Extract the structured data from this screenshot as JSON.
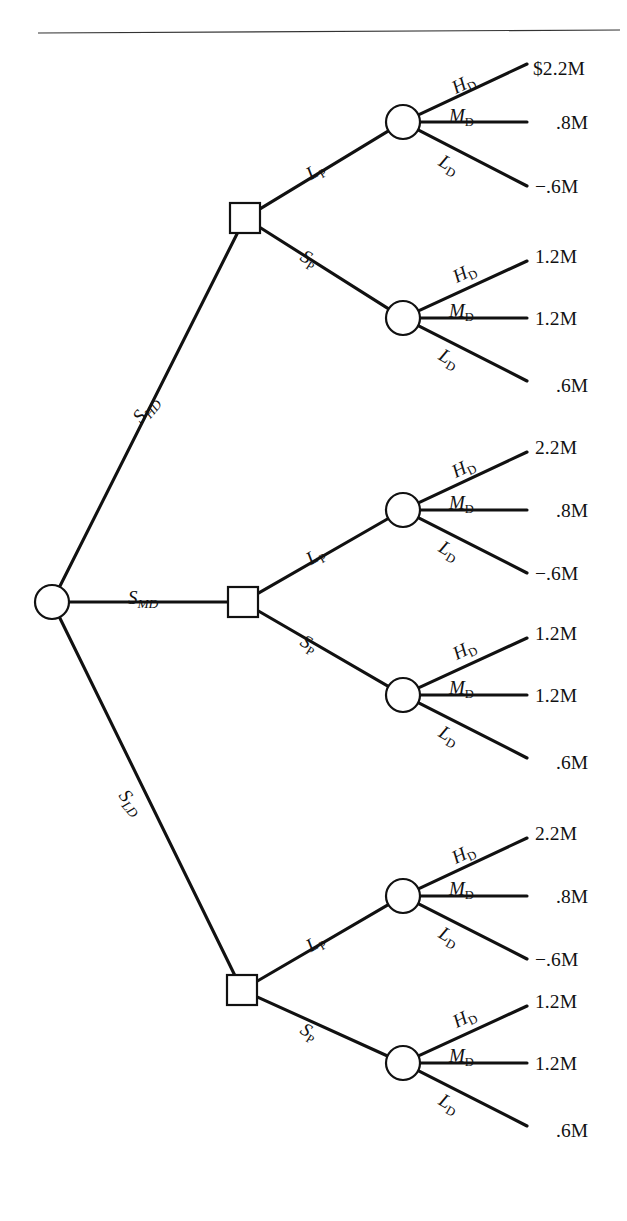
{
  "diagram": {
    "type": "decision-tree",
    "top_rule": {
      "present": true,
      "x1": 38,
      "y1": 33,
      "x2": 620,
      "y2": 30
    }
  },
  "root": {
    "node_type": "chance",
    "label": "root-chance-node",
    "x": 52,
    "y": 602,
    "r": 17
  },
  "state_branches": [
    {
      "id": "S_HD",
      "base": "S",
      "sub": "HD",
      "target_x": 245,
      "target_y": 218,
      "label_x": 128,
      "label_y": 413,
      "rotate": -50
    },
    {
      "id": "S_MD",
      "base": "S",
      "sub": "MD",
      "target_x": 243,
      "target_y": 602,
      "label_x": 128,
      "label_y": 587,
      "rotate": 0
    },
    {
      "id": "S_LD",
      "base": "S",
      "sub": "LD",
      "target_x": 242,
      "target_y": 990,
      "label_x": 131,
      "label_y": 785,
      "rotate": 50
    }
  ],
  "groups": [
    {
      "id": "group-high-demand",
      "state": "S_HD",
      "decision_node": {
        "x": 245,
        "y": 218,
        "size": 30
      },
      "price_branches": [
        {
          "id": "LP",
          "base": "L",
          "sub": "P",
          "label_x": 302,
          "label_y": 166,
          "rotate": -31,
          "chance_node": {
            "x": 403,
            "y": 122,
            "r": 17
          },
          "outcomes": [
            {
              "demand": "H",
              "sub": "D",
              "value": "$2.2M",
              "label_x": 448,
              "label_y": 79,
              "rotate": -27,
              "end_x": 527,
              "end_y": 64,
              "text_x": 533,
              "text_y": 58
            },
            {
              "demand": "M",
              "sub": "D",
              "value": ".8M",
              "label_x": 449,
              "label_y": 105,
              "rotate": 0,
              "end_x": 527,
              "end_y": 122,
              "text_x": 556,
              "text_y": 112
            },
            {
              "demand": "L",
              "sub": "D",
              "value": "−.6M",
              "label_x": 446,
              "label_y": 150,
              "rotate": 30,
              "end_x": 527,
              "end_y": 186,
              "text_x": 535,
              "text_y": 176
            }
          ]
        },
        {
          "id": "SP",
          "base": "S",
          "sub": "P",
          "label_x": 308,
          "label_y": 245,
          "rotate": 32,
          "chance_node": {
            "x": 403,
            "y": 318,
            "r": 17
          },
          "outcomes": [
            {
              "demand": "H",
              "sub": "D",
              "value": "1.2M",
              "label_x": 449,
              "label_y": 268,
              "rotate": -27,
              "end_x": 527,
              "end_y": 261,
              "text_x": 535,
              "text_y": 246
            },
            {
              "demand": "M",
              "sub": "D",
              "value": "1.2M",
              "label_x": 449,
              "label_y": 300,
              "rotate": 0,
              "end_x": 527,
              "end_y": 318,
              "text_x": 535,
              "text_y": 308
            },
            {
              "demand": "L",
              "sub": "D",
              "value": ".6M",
              "label_x": 446,
              "label_y": 344,
              "rotate": 30,
              "end_x": 527,
              "end_y": 381,
              "text_x": 556,
              "text_y": 375
            }
          ]
        }
      ]
    },
    {
      "id": "group-medium-demand",
      "state": "S_MD",
      "decision_node": {
        "x": 243,
        "y": 602,
        "size": 30
      },
      "price_branches": [
        {
          "id": "LP",
          "base": "L",
          "sub": "P",
          "label_x": 302,
          "label_y": 551,
          "rotate": -31,
          "chance_node": {
            "x": 403,
            "y": 510,
            "r": 17
          },
          "outcomes": [
            {
              "demand": "H",
              "sub": "D",
              "value": "2.2M",
              "label_x": 448,
              "label_y": 463,
              "rotate": -27,
              "end_x": 527,
              "end_y": 452,
              "text_x": 535,
              "text_y": 437
            },
            {
              "demand": "M",
              "sub": "D",
              "value": ".8M",
              "label_x": 449,
              "label_y": 492,
              "rotate": 0,
              "end_x": 527,
              "end_y": 510,
              "text_x": 556,
              "text_y": 500
            },
            {
              "demand": "L",
              "sub": "D",
              "value": "−.6M",
              "label_x": 446,
              "label_y": 536,
              "rotate": 30,
              "end_x": 527,
              "end_y": 573,
              "text_x": 535,
              "text_y": 563
            }
          ]
        },
        {
          "id": "SP",
          "base": "S",
          "sub": "P",
          "label_x": 308,
          "label_y": 630,
          "rotate": 32,
          "chance_node": {
            "x": 403,
            "y": 695,
            "r": 17
          },
          "outcomes": [
            {
              "demand": "H",
              "sub": "D",
              "value": "1.2M",
              "label_x": 449,
              "label_y": 645,
              "rotate": -27,
              "end_x": 527,
              "end_y": 638,
              "text_x": 535,
              "text_y": 623
            },
            {
              "demand": "M",
              "sub": "D",
              "value": "1.2M",
              "label_x": 449,
              "label_y": 677,
              "rotate": 0,
              "end_x": 527,
              "end_y": 695,
              "text_x": 535,
              "text_y": 685
            },
            {
              "demand": "L",
              "sub": "D",
              "value": ".6M",
              "label_x": 446,
              "label_y": 721,
              "rotate": 30,
              "end_x": 527,
              "end_y": 758,
              "text_x": 556,
              "text_y": 752
            }
          ]
        }
      ]
    },
    {
      "id": "group-low-demand",
      "state": "S_LD",
      "decision_node": {
        "x": 242,
        "y": 990,
        "size": 30
      },
      "price_branches": [
        {
          "id": "LP",
          "base": "L",
          "sub": "P",
          "label_x": 302,
          "label_y": 938,
          "rotate": -31,
          "chance_node": {
            "x": 403,
            "y": 896,
            "r": 17
          },
          "outcomes": [
            {
              "demand": "H",
              "sub": "D",
              "value": "2.2M",
              "label_x": 448,
              "label_y": 849,
              "rotate": -27,
              "end_x": 527,
              "end_y": 838,
              "text_x": 535,
              "text_y": 823
            },
            {
              "demand": "M",
              "sub": "D",
              "value": ".8M",
              "label_x": 449,
              "label_y": 878,
              "rotate": 0,
              "end_x": 527,
              "end_y": 896,
              "text_x": 556,
              "text_y": 886
            },
            {
              "demand": "L",
              "sub": "D",
              "value": "−.6M",
              "label_x": 446,
              "label_y": 922,
              "rotate": 30,
              "end_x": 527,
              "end_y": 959,
              "text_x": 535,
              "text_y": 949
            }
          ]
        },
        {
          "id": "SP",
          "base": "S",
          "sub": "P",
          "label_x": 308,
          "label_y": 1018,
          "rotate": 32,
          "chance_node": {
            "x": 403,
            "y": 1063,
            "r": 17
          },
          "outcomes": [
            {
              "demand": "H",
              "sub": "D",
              "value": "1.2M",
              "label_x": 449,
              "label_y": 1013,
              "rotate": -27,
              "end_x": 527,
              "end_y": 1006,
              "text_x": 535,
              "text_y": 991
            },
            {
              "demand": "M",
              "sub": "D",
              "value": "1.2M",
              "label_x": 449,
              "label_y": 1045,
              "rotate": 0,
              "end_x": 527,
              "end_y": 1063,
              "text_x": 535,
              "text_y": 1053
            },
            {
              "demand": "L",
              "sub": "D",
              "value": ".6M",
              "label_x": 446,
              "label_y": 1089,
              "rotate": 30,
              "end_x": 527,
              "end_y": 1126,
              "text_x": 556,
              "text_y": 1120
            }
          ]
        }
      ]
    }
  ],
  "colors": {
    "line": "#111111",
    "rule": "#333333",
    "background": "#ffffff",
    "text": "#111111"
  }
}
